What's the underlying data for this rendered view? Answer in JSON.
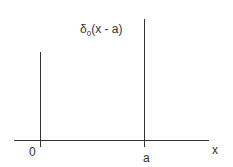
{
  "diagram": {
    "title_symbol": "δ",
    "title_sub": "0",
    "title_rest": "(x - a)",
    "origin_label": "0",
    "shift_label": "a",
    "axis_label": "x"
  }
}
